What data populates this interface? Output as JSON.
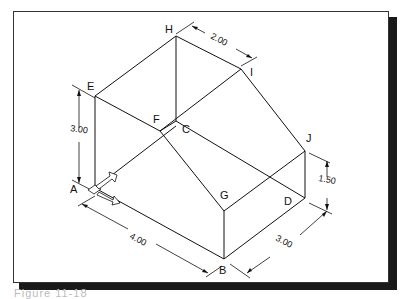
{
  "figure": {
    "caption": "Figure 11-18",
    "vertices": {
      "A": {
        "label": "A",
        "x": 95,
        "y": 188
      },
      "B": {
        "label": "B",
        "x": 224,
        "y": 259
      },
      "C": {
        "label": "C",
        "x": 176,
        "y": 130
      },
      "D": {
        "label": "D",
        "x": 305,
        "y": 198
      },
      "E": {
        "label": "E",
        "x": 95,
        "y": 96
      },
      "F": {
        "label": "F",
        "x": 160,
        "y": 131
      },
      "G": {
        "label": "G",
        "x": 224,
        "y": 211
      },
      "H": {
        "label": "H",
        "x": 176,
        "y": 36
      },
      "I": {
        "label": "I",
        "x": 241,
        "y": 69
      },
      "J": {
        "label": "J",
        "x": 305,
        "y": 151
      }
    },
    "dimensions": {
      "height_left": "3.00",
      "length_front": "4.00",
      "width_right": "3.00",
      "height_right": "1.50",
      "top_width": "2.00"
    }
  }
}
